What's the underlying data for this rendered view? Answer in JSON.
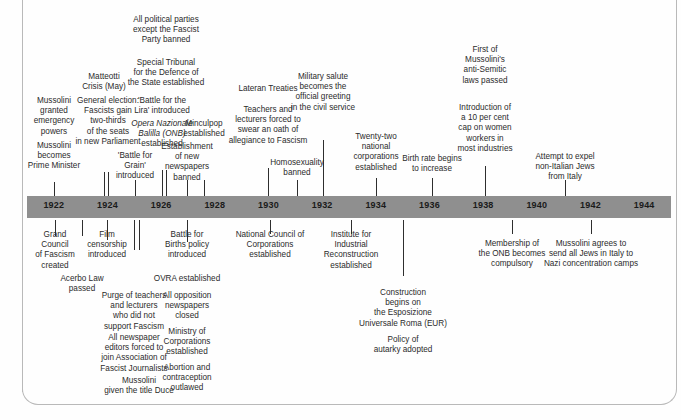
{
  "figure": {
    "type": "timeline",
    "axis": {
      "start_year": 1921,
      "end_year": 1945,
      "tick_years": [
        1922,
        1924,
        1926,
        1928,
        1930,
        1932,
        1934,
        1936,
        1938,
        1940,
        1942,
        1944
      ],
      "bar_color": "#8f8f8f",
      "year_labels": [
        "1922",
        "1924",
        "1926",
        "1928",
        "1930",
        "1932",
        "1934",
        "1936",
        "1938",
        "1940",
        "1942",
        "1944"
      ]
    },
    "events_above": [
      {
        "text": "Mussolini\nbecomes\nPrime Minister",
        "year": 1922,
        "x": 54,
        "top": 141,
        "width": 76,
        "tick_top": 182,
        "tick_height": 14
      },
      {
        "text": "Mussolini\ngranted\nemergency\npowers",
        "year": 1922,
        "x": 54,
        "top": 96,
        "width": 64,
        "tick_top": 182,
        "tick_height": 14
      },
      {
        "text": "General election:\nFascists gain\ntwo-thirds\nof the seats\nin new Parliament",
        "year": 1924,
        "x": 108,
        "top": 96,
        "width": 98,
        "tick_top": 172,
        "tick_height": 24
      },
      {
        "text": "Matteotti\nCrisis (May)",
        "year": 1924,
        "x": 104,
        "top": 72,
        "width": 62,
        "tick_top": 172,
        "tick_height": 24
      },
      {
        "text": "'Battle for\nGrain'\nintroduced",
        "year": 1925,
        "x": 135,
        "top": 151,
        "width": 58,
        "tick_top": 180,
        "tick_height": 16
      },
      {
        "text": "'Battle for the\nLira' introduced",
        "year": 1926,
        "x": 162,
        "top": 96,
        "width": 80,
        "tick_top": 170,
        "tick_height": 26
      },
      {
        "text": "Opera Nazionale\nBalilla (ONB)\nestablished",
        "year": 1926,
        "x": 162,
        "top": 119,
        "width": 84,
        "tick_top": 170,
        "tick_height": 26,
        "italic_lines": [
          0,
          1
        ]
      },
      {
        "text": "Special Tribunal\nfor the  Defence of\nthe State established",
        "year": 1926,
        "x": 166,
        "top": 58,
        "width": 104,
        "tick_top": 170,
        "tick_height": 26
      },
      {
        "text": "All political parties\nexcept the Fascist\nParty banned",
        "year": 1926,
        "x": 166,
        "top": 15,
        "width": 100,
        "tick_top": 170,
        "tick_height": 26
      },
      {
        "text": "Establishment\nof new\nnewspapers\nbanned",
        "year": 1928,
        "x": 187,
        "top": 142,
        "width": 66,
        "tick_top": 180,
        "tick_height": 16
      },
      {
        "text": "Minculpop\nestablished",
        "year": 1927,
        "x": 204,
        "top": 119,
        "width": 58,
        "tick_top": 180,
        "tick_height": 16
      },
      {
        "text": "Lateran Treaties",
        "year": 1929,
        "x": 268,
        "top": 84,
        "width": 84,
        "tick_top": 168,
        "tick_height": 28
      },
      {
        "text": "Teachers and\nlecturers forced to\nswear an oath of\nallegiance to Fascism",
        "year": 1929,
        "x": 268,
        "top": 105,
        "width": 104,
        "tick_top": 168,
        "tick_height": 28
      },
      {
        "text": "Homosexuality\nbanned",
        "year": 1931,
        "x": 297,
        "top": 158,
        "width": 74,
        "tick_top": 180,
        "tick_height": 16
      },
      {
        "text": "Military salute\nbecomes the\nofficial greeting\nin the civil service",
        "year": 1932,
        "x": 323,
        "top": 72,
        "width": 90,
        "tick_top": 140,
        "tick_height": 56
      },
      {
        "text": "Twenty-two\nnational\ncorporations\nestablished",
        "year": 1934,
        "x": 376,
        "top": 132,
        "width": 66,
        "tick_top": 178,
        "tick_height": 18
      },
      {
        "text": "Birth rate begins\nto increase",
        "year": 1936,
        "x": 432,
        "top": 154,
        "width": 86,
        "tick_top": 178,
        "tick_height": 18
      },
      {
        "text": "Introduction of\na 10 per cent\ncap on women\nworkers in\nmost industries",
        "year": 1938,
        "x": 485,
        "top": 103,
        "width": 76,
        "tick_top": 166,
        "tick_height": 30
      },
      {
        "text": "First of\nMussolini's\nanti-Semitic\nlaws passed",
        "year": 1938,
        "x": 485,
        "top": 45,
        "width": 66,
        "tick_top": 166,
        "tick_height": 30
      },
      {
        "text": "Attempt to expel\nnon-Italian Jews\nfrom Italy",
        "year": 1942,
        "x": 565,
        "top": 152,
        "width": 88,
        "tick_top": 180,
        "tick_height": 16
      }
    ],
    "events_below": [
      {
        "text": "Grand\nCouncil\nof Fascism\ncreated",
        "year": 1922,
        "x": 55,
        "top": 230,
        "width": 62,
        "tick_top": 220,
        "tick_height": 16
      },
      {
        "text": "Acerbo Law\npassed",
        "year": 1923,
        "x": 82,
        "top": 274,
        "width": 66,
        "tick_top": 220,
        "tick_height": 16
      },
      {
        "text": "Film\ncensorship\nintroduced",
        "year": 1924,
        "x": 107,
        "top": 230,
        "width": 62,
        "tick_top": 220,
        "tick_height": 20
      },
      {
        "text": "Purge of teachers\nand lecturers\nwho did not\nsupport Fascism",
        "year": 1925,
        "x": 134,
        "top": 291,
        "width": 92,
        "tick_top": 220,
        "tick_height": 30
      },
      {
        "text": "All newspaper\neditors forced to\njoin Association of\nFascist Journalists",
        "year": 1925,
        "x": 134,
        "top": 333,
        "width": 98,
        "tick_top": 220,
        "tick_height": 30
      },
      {
        "text": "Mussolini\ngiven the title Duce",
        "year": 1925,
        "x": 139,
        "top": 376,
        "width": 104,
        "tick_top": 220,
        "tick_height": 30
      },
      {
        "text": "Battle for\nBirths policy\nintroduced",
        "year": 1927,
        "x": 187,
        "top": 230,
        "width": 68,
        "tick_top": 220,
        "tick_height": 22
      },
      {
        "text": "OVRA established",
        "year": 1927,
        "x": 187,
        "top": 274,
        "width": 92,
        "tick_top": 220,
        "tick_height": 22
      },
      {
        "text": "All opposition\nnewspapers\nclosed",
        "year": 1927,
        "x": 187,
        "top": 291,
        "width": 72,
        "tick_top": 220,
        "tick_height": 22
      },
      {
        "text": "Ministry of\nCorporations\nestablished",
        "year": 1927,
        "x": 187,
        "top": 327,
        "width": 70,
        "tick_top": 220,
        "tick_height": 22
      },
      {
        "text": "Abortion and\ncontraception\noutlawed",
        "year": 1927,
        "x": 187,
        "top": 363,
        "width": 70,
        "tick_top": 220,
        "tick_height": 22
      },
      {
        "text": "National Council of\nCorporations\nestablished",
        "year": 1930,
        "x": 270,
        "top": 230,
        "width": 106,
        "tick_top": 220,
        "tick_height": 14
      },
      {
        "text": "Institute for\nIndustrial\nReconstruction\nestablished",
        "year": 1933,
        "x": 351,
        "top": 230,
        "width": 78,
        "tick_top": 220,
        "tick_height": 14
      },
      {
        "text": "Construction\nbegins on\nthe Esposizione\nUniversale Roma (EUR)",
        "year": 1936,
        "x": 403,
        "top": 288,
        "width": 118,
        "tick_top": 220,
        "tick_height": 56
      },
      {
        "text": "Policy of\nautarky adopted",
        "year": 1936,
        "x": 403,
        "top": 335,
        "width": 90,
        "tick_top": 220,
        "tick_height": 56
      },
      {
        "text": "Membership of\nthe ONB becomes\ncompulsory",
        "year": 1939,
        "x": 512,
        "top": 239,
        "width": 90,
        "tick_top": 220,
        "tick_height": 14
      },
      {
        "text": "Mussolini agrees to\nsend all Jews in Italy to\nNazi concentration camps",
        "year": 1942,
        "x": 591,
        "top": 239,
        "width": 122,
        "tick_top": 220,
        "tick_height": 14
      }
    ]
  }
}
